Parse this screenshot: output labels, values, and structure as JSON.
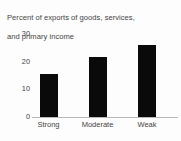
{
  "chart_data": {
    "type": "bar",
    "title": "Percent of exports of goods, services, and primary income",
    "title_line1": "Percent of exports of goods, services,",
    "title_line2": "and primary income",
    "xlabel": "",
    "ylabel": "",
    "categories": [
      "Strong",
      "Moderate",
      "Weak"
    ],
    "values": [
      15.5,
      21.5,
      26
    ],
    "yticks": [
      0,
      10,
      20,
      30
    ],
    "ytick_labels": [
      "0",
      "10",
      "20",
      "30"
    ],
    "ylim": [
      0,
      30
    ],
    "grid": false,
    "legend": false,
    "bar_color": "#0a0a0a",
    "axis_color": "#b9b9b9",
    "text_color": "#444444",
    "background": "#fdfdfd"
  }
}
